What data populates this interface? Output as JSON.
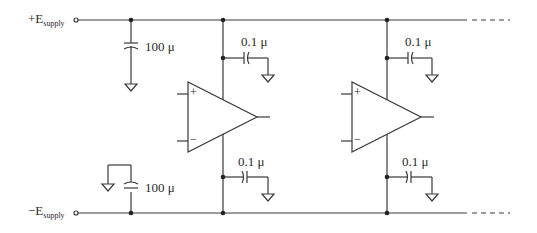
{
  "diagram": {
    "type": "op-amp power supply decoupling schematic",
    "rails": {
      "positive_label": "+E",
      "positive_sub": "supply",
      "negative_label": "−E",
      "negative_sub": "supply"
    },
    "bulk_caps": {
      "top_value": "100 μ",
      "bottom_value": "100 μ"
    },
    "opamps": [
      {
        "top_cap_value": "0.1 μ",
        "bottom_cap_value": "0.1 μ",
        "plus": "+",
        "minus": "−"
      },
      {
        "top_cap_value": "0.1 μ",
        "bottom_cap_value": "0.1 μ",
        "plus": "+",
        "minus": "−"
      }
    ],
    "colors": {
      "wire": "#3a3a3a",
      "text": "#2a2a2a",
      "background": "#ffffff"
    }
  }
}
